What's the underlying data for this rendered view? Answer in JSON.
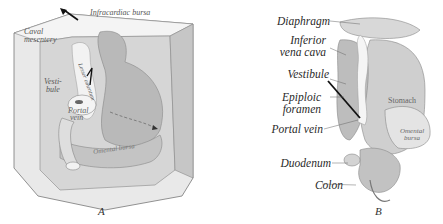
{
  "figure": {
    "panels": [
      {
        "id": "A",
        "letter": "A",
        "labels": {
          "infracardiac_bursa": "Infracardiac bursa",
          "caval_mesentery_1": "Caval",
          "caval_mesentery_2": "mesentery",
          "lesser_omentum": "Lesser omentum",
          "vestibule_1": "Vesti-",
          "vestibule_2": "bule",
          "portal_vein_1": "Portal",
          "portal_vein_2": "vein",
          "omental_bursa": "Omental bursa"
        }
      },
      {
        "id": "B",
        "letter": "B",
        "labels": {
          "diaphragm": "Diaphragm",
          "inferior_vena_cava_1": "Inferior",
          "inferior_vena_cava_2": "vena cava",
          "vestibule": "Vestibule",
          "epiploic_foramen_1": "Epiploic",
          "epiploic_foramen_2": "foramen",
          "portal_vein": "Portal vein",
          "duodenum": "Duodenum",
          "colon": "Colon",
          "stomach": "Stomach",
          "omental_bursa_1": "Omental",
          "omental_bursa_2": "bursa"
        }
      }
    ],
    "colors": {
      "background": "#ffffff",
      "line": "#555555",
      "shade_light": "#e6e6e6",
      "shade_mid": "#c8c8c8",
      "shade_dark": "#9a9a9a",
      "arrow": "#111111"
    }
  }
}
